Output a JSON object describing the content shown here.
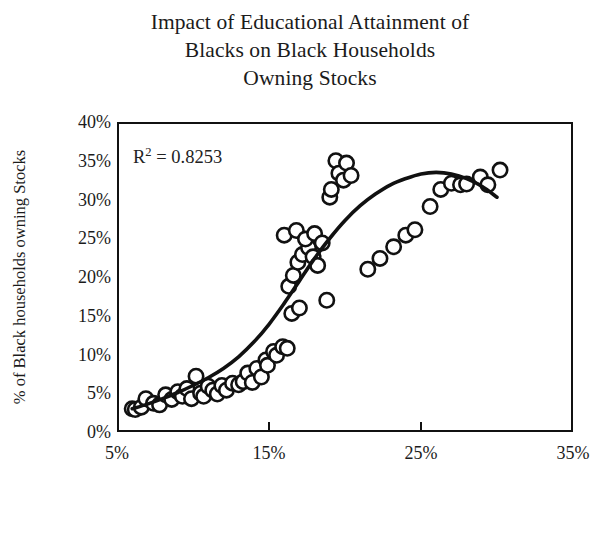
{
  "chart_data": {
    "type": "scatter",
    "title": "Impact of Educational Attainment of\nBlacks on Black Households\nOwning Stocks",
    "xlabel": "% of Black Americans Who Completed Their\nBachelor's Degree",
    "ylabel": "% of Black households owning Stocks",
    "annotation": "0.8253",
    "annotation_prefix": "R",
    "annotation_exponent": "2",
    "annotation_operator": " = ",
    "grid": false,
    "legend": "none",
    "xlim": [
      5,
      35
    ],
    "ylim": [
      0,
      40
    ],
    "xticks": [
      "5%",
      "15%",
      "25%",
      "35%"
    ],
    "xtick_values": [
      5,
      15,
      25,
      35
    ],
    "yticks": [
      "0%",
      "5%",
      "10%",
      "15%",
      "20%",
      "25%",
      "30%",
      "35%",
      "40%"
    ],
    "ytick_values": [
      0,
      5,
      10,
      15,
      20,
      25,
      30,
      35,
      40
    ],
    "marker": "open-circle",
    "marker_color": "#ffffff",
    "marker_edge_color": "#111111",
    "trendline_color": "#111111",
    "trendline_type": "cubic-polynomial",
    "points": [
      [
        6.0,
        3.0
      ],
      [
        6.2,
        2.9
      ],
      [
        6.6,
        3.2
      ],
      [
        6.9,
        4.3
      ],
      [
        7.4,
        3.7
      ],
      [
        7.8,
        3.5
      ],
      [
        8.2,
        4.8
      ],
      [
        8.6,
        4.2
      ],
      [
        9.0,
        5.2
      ],
      [
        9.3,
        4.6
      ],
      [
        9.6,
        5.6
      ],
      [
        9.9,
        4.3
      ],
      [
        10.2,
        7.2
      ],
      [
        10.5,
        5.0
      ],
      [
        10.7,
        4.6
      ],
      [
        11.0,
        5.9
      ],
      [
        11.3,
        5.4
      ],
      [
        11.6,
        4.9
      ],
      [
        11.9,
        6.0
      ],
      [
        12.2,
        5.4
      ],
      [
        12.6,
        6.3
      ],
      [
        13.0,
        6.1
      ],
      [
        13.3,
        6.5
      ],
      [
        13.6,
        7.6
      ],
      [
        13.9,
        6.4
      ],
      [
        14.2,
        8.2
      ],
      [
        14.5,
        7.1
      ],
      [
        14.8,
        9.3
      ],
      [
        14.9,
        8.6
      ],
      [
        15.3,
        10.4
      ],
      [
        15.5,
        9.9
      ],
      [
        15.9,
        11.0
      ],
      [
        16.2,
        10.8
      ],
      [
        16.5,
        15.3
      ],
      [
        17.0,
        16.0
      ],
      [
        16.3,
        18.8
      ],
      [
        16.6,
        20.2
      ],
      [
        16.9,
        21.9
      ],
      [
        17.2,
        22.9
      ],
      [
        17.6,
        23.8
      ],
      [
        17.9,
        22.6
      ],
      [
        18.2,
        21.5
      ],
      [
        16.0,
        25.4
      ],
      [
        16.8,
        26.0
      ],
      [
        17.4,
        24.9
      ],
      [
        18.0,
        25.6
      ],
      [
        18.5,
        24.4
      ],
      [
        18.8,
        17.0
      ],
      [
        19.0,
        30.3
      ],
      [
        19.1,
        31.3
      ],
      [
        19.4,
        35.0
      ],
      [
        19.6,
        33.4
      ],
      [
        19.9,
        32.5
      ],
      [
        20.1,
        34.7
      ],
      [
        20.4,
        33.1
      ],
      [
        21.5,
        21.0
      ],
      [
        22.3,
        22.4
      ],
      [
        23.2,
        23.9
      ],
      [
        24.0,
        25.4
      ],
      [
        24.6,
        26.1
      ],
      [
        25.6,
        29.1
      ],
      [
        26.3,
        31.3
      ],
      [
        27.0,
        32.1
      ],
      [
        27.6,
        31.9
      ],
      [
        28.0,
        32.0
      ],
      [
        28.9,
        32.9
      ],
      [
        29.4,
        31.9
      ],
      [
        30.2,
        33.8
      ]
    ],
    "trendline": [
      [
        6.0,
        3.0
      ],
      [
        7.0,
        3.6
      ],
      [
        8.0,
        4.3
      ],
      [
        9.0,
        5.1
      ],
      [
        10.0,
        6.0
      ],
      [
        11.0,
        7.0
      ],
      [
        12.0,
        8.2
      ],
      [
        13.0,
        9.7
      ],
      [
        14.0,
        11.6
      ],
      [
        15.0,
        13.9
      ],
      [
        16.0,
        16.6
      ],
      [
        17.0,
        19.5
      ],
      [
        18.0,
        22.4
      ],
      [
        19.0,
        25.0
      ],
      [
        20.0,
        27.3
      ],
      [
        21.0,
        29.2
      ],
      [
        22.0,
        30.7
      ],
      [
        23.0,
        31.9
      ],
      [
        24.0,
        32.7
      ],
      [
        25.0,
        33.3
      ],
      [
        26.0,
        33.5
      ],
      [
        27.0,
        33.3
      ],
      [
        28.0,
        32.7
      ],
      [
        29.0,
        31.7
      ],
      [
        30.0,
        30.3
      ]
    ]
  }
}
